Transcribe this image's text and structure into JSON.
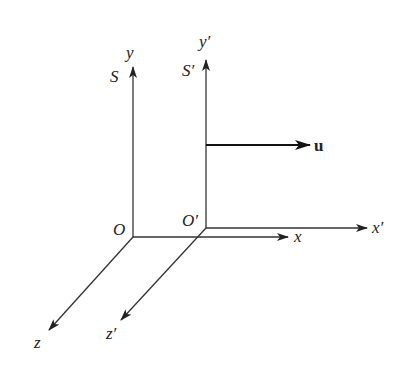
{
  "diagram": {
    "frame_S": {
      "label": "S",
      "origin_label": "O",
      "x_label": "x",
      "y_label": "y",
      "z_label": "z"
    },
    "frame_S_prime": {
      "label": "S′",
      "origin_label": "O′",
      "x_label": "x′",
      "y_label": "y′",
      "z_label": "z′"
    },
    "velocity": {
      "label": "u"
    },
    "colors": {
      "stroke": "#333333",
      "text": "#222222",
      "background": "#ffffff"
    }
  }
}
